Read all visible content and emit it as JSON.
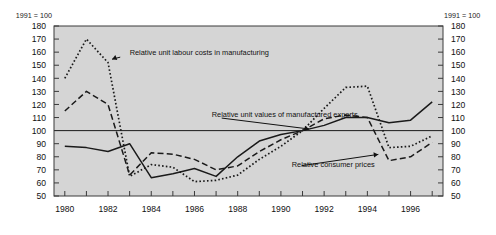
{
  "figure": {
    "background_color": "#ffffff",
    "plot_background_color": "#d5d5d5",
    "frame_color": "#3a3a3a",
    "line_color": "#1a1a1a",
    "note_left": "1991 = 100",
    "note_right": "1991 = 100"
  },
  "chart_data": {
    "type": "line",
    "title": "",
    "subtitle": "",
    "xlabel": "",
    "ylabel": "",
    "unit_note": "1991 = 100",
    "xlim": [
      1979.5,
      1997.5
    ],
    "ylim": [
      50,
      180
    ],
    "ytick_step": 10,
    "grid": false,
    "legend_position": "inline-annotations",
    "reference_line": {
      "value": 100,
      "label": "1991 = 100 base line",
      "color": "#1a1a1a"
    },
    "yticks": [
      50,
      60,
      70,
      80,
      90,
      100,
      110,
      120,
      130,
      140,
      150,
      160,
      170,
      180
    ],
    "ytick_labels": [
      "50",
      "60",
      "70",
      "80",
      "90",
      "100",
      "110",
      "120",
      "130",
      "140",
      "150",
      "160",
      "170",
      "180"
    ],
    "xticks": [
      1980,
      1981,
      1982,
      1983,
      1984,
      1985,
      1986,
      1987,
      1988,
      1989,
      1990,
      1991,
      1992,
      1993,
      1994,
      1995,
      1996,
      1997
    ],
    "xtick_labels_shown": [
      "1980",
      "1982",
      "1984",
      "1986",
      "1988",
      "1990",
      "1992",
      "1994",
      "1996"
    ],
    "xtick_labels_years": [
      1980,
      1982,
      1984,
      1986,
      1988,
      1990,
      1992,
      1994,
      1996
    ],
    "x": [
      1980,
      1981,
      1982,
      1983,
      1984,
      1985,
      1986,
      1987,
      1988,
      1989,
      1990,
      1991,
      1992,
      1993,
      1994,
      1995,
      1996,
      1997
    ],
    "series": [
      {
        "name": "Relative unit values of manufactured exports",
        "style": "solid",
        "color": "#1a1a1a",
        "values": [
          88,
          87,
          84,
          90,
          64,
          67,
          71,
          65,
          80,
          92,
          97,
          100,
          104,
          110,
          110,
          106,
          108,
          122
        ]
      },
      {
        "name": "Relative consumer prices",
        "style": "dashed",
        "color": "#1a1a1a",
        "values": [
          115,
          130,
          120,
          66,
          83,
          82,
          78,
          70,
          73,
          84,
          93,
          100,
          109,
          112,
          110,
          77,
          80,
          91
        ]
      },
      {
        "name": "Relative unit labour costs in manufacturing",
        "style": "dotted",
        "color": "#1a1a1a",
        "values": [
          140,
          170,
          152,
          65,
          74,
          72,
          61,
          62,
          66,
          78,
          88,
          100,
          117,
          133,
          134,
          87,
          88,
          96
        ]
      }
    ],
    "annotations": [
      {
        "text": "Relative unit labour costs in manufacturing",
        "target_series": "Relative unit labour costs in manufacturing",
        "text_x": 1983.0,
        "text_y": 160,
        "arrow_to_x": 1982.1,
        "arrow_to_y": 154
      },
      {
        "text": "Relative unit values of manufactured exports",
        "target_series": "Relative unit values of manufactured exports",
        "text_x": 1986.8,
        "text_y": 112,
        "arrow_to_x": 1991.4,
        "arrow_to_y": 101
      },
      {
        "text": "Relative consumer prices",
        "target_series": "Relative consumer prices",
        "text_x": 1990.5,
        "text_y": 74,
        "arrow_to_x": 1994.6,
        "arrow_to_y": 82
      }
    ]
  }
}
